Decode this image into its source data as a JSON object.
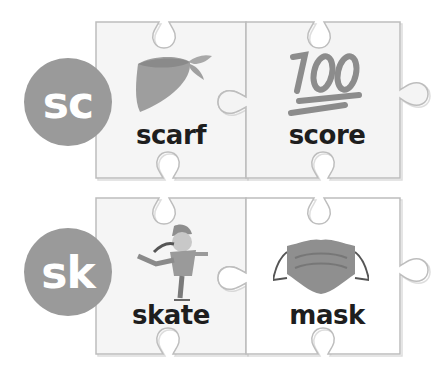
{
  "rows": [
    {
      "blend": "sc",
      "cards": [
        {
          "word": "scarf",
          "icon": "scarf-icon"
        },
        {
          "word": "score",
          "icon": "hundred-points-icon"
        }
      ]
    },
    {
      "blend": "sk",
      "cards": [
        {
          "word": "skate",
          "icon": "ice-skater-icon"
        },
        {
          "word": "mask",
          "icon": "face-mask-icon"
        }
      ]
    }
  ],
  "colors": {
    "circle": "#9a9a9a",
    "text": "#1e1e1e",
    "outline": "#bdbdbd",
    "left_card": "#f5f5f5",
    "right_card": "#ffffff"
  }
}
